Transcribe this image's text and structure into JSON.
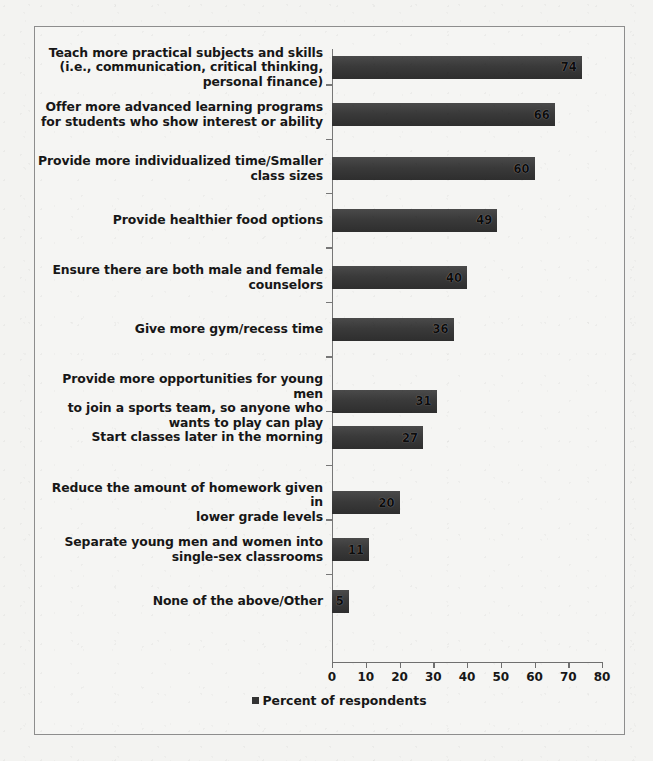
{
  "chart_data": {
    "type": "bar",
    "orientation": "horizontal",
    "title": "",
    "xlabel": "",
    "ylabel": "",
    "xlim": [
      0,
      80
    ],
    "xticks": [
      "0",
      "10",
      "20",
      "30",
      "40",
      "50",
      "60",
      "70",
      "80"
    ],
    "grid": false,
    "legend_position": "bottom",
    "legend": [
      "Percent of respondents"
    ],
    "categories": [
      "Teach more practical subjects and skills\n(i.e., communication, critical thinking,\npersonal finance)",
      "Offer more advanced learning programs\nfor students who show interest or ability",
      "Provide more individualized time/Smaller\nclass sizes",
      "Provide healthier food options",
      "Ensure there are both male and female\ncounselors",
      "Give more gym/recess time",
      "Provide more opportunities for young men\nto join a sports team, so anyone who\nwants to play can play",
      "Start classes later in the morning",
      "Reduce the amount of homework given in\nlower grade levels",
      "Separate young men and women into\nsingle-sex classrooms",
      "None of the above/Other"
    ],
    "values": [
      74,
      66,
      60,
      49,
      40,
      36,
      31,
      27,
      20,
      11,
      5
    ],
    "series": [
      {
        "name": "Percent of respondents",
        "values": [
          74,
          66,
          60,
          49,
          40,
          36,
          31,
          27,
          20,
          11,
          5
        ]
      }
    ]
  },
  "legend": {
    "swatch_icon": "square-marker-icon",
    "label": "Percent of respondents"
  }
}
